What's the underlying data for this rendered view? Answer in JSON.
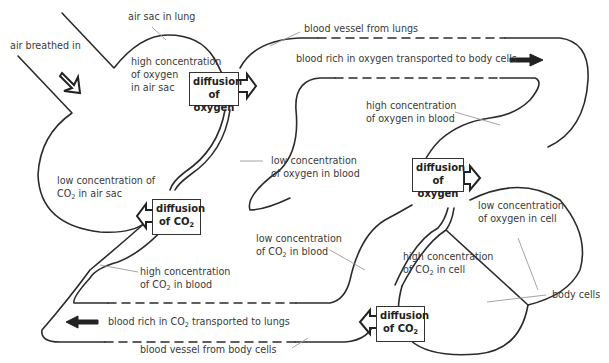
{
  "diagram": {
    "labels": {
      "air_breathed_in": "air breathed in",
      "air_sac_in_lung": "air sac in lung",
      "high_o2_air_sac_1": "high concentration",
      "high_o2_air_sac_2": "of oxygen",
      "high_o2_air_sac_3": "in air sac",
      "vessel_from_lungs": "blood vessel from lungs",
      "blood_rich_o2": "blood rich in oxygen transported to body cells",
      "high_o2_blood_1": "high concentration",
      "high_o2_blood_2": "of oxygen in blood",
      "low_o2_blood_1": "low concentration",
      "low_o2_blood_2": "of oxygen in blood",
      "low_co2_air_sac_1": "low concentration of",
      "low_co2_air_sac_2a": "CO",
      "low_co2_air_sac_2sub": "2",
      "low_co2_air_sac_2b": " in air sac",
      "low_o2_cell_1": "low concentration",
      "low_o2_cell_2": "of oxygen in cell",
      "low_co2_blood_1": "low concentration",
      "low_co2_blood_2a": "of CO",
      "low_co2_blood_2sub": "2",
      "low_co2_blood_2b": " in blood",
      "high_co2_cell_1": "high concentration",
      "high_co2_cell_2a": "of CO",
      "high_co2_cell_2sub": "2",
      "high_co2_cell_2b": " in cell",
      "high_co2_blood_1": "high concentration",
      "high_co2_blood_2a": "of CO",
      "high_co2_blood_2sub": "2",
      "high_co2_blood_2b": " in blood",
      "body_cells": "body cells",
      "blood_rich_co2_a": "blood rich in CO",
      "blood_rich_co2_sub": "2",
      "blood_rich_co2_b": " transported to lungs",
      "vessel_from_body": "blood vessel from body cells"
    },
    "boxes": {
      "diff_o2_lung_1": "diffusion",
      "diff_o2_lung_2": "of oxygen",
      "diff_co2_lung_1": "diffusion",
      "diff_co2_lung_2a": "of CO",
      "diff_co2_lung_2sub": "2",
      "diff_o2_cell_1": "diffusion",
      "diff_o2_cell_2": "of oxygen",
      "diff_co2_cell_1": "diffusion",
      "diff_co2_cell_2a": "of CO",
      "diff_co2_cell_2sub": "2"
    },
    "colors": {
      "line": "#2b2b2b",
      "leader": "#9a9a9a",
      "text": "#3a3a3a"
    }
  }
}
